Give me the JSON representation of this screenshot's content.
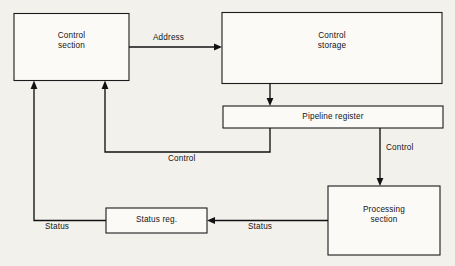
{
  "diagram": {
    "background_color": "#f3f1ec",
    "line_color": "#111111",
    "box_fill": "#fbfaf7",
    "nodes": {
      "control_section": {
        "label": "Control\nsection",
        "line1": "Control",
        "line2": "section"
      },
      "control_storage": {
        "label": "Control\nstorage",
        "line1": "Control",
        "line2": "storage"
      },
      "pipeline_register": {
        "label": "Pipeline register"
      },
      "processing_section": {
        "label": "Processing\nsection",
        "line1": "Processing",
        "line2": "section"
      },
      "status_register": {
        "label": "Status reg."
      }
    },
    "edges": {
      "address": {
        "label": "Address",
        "from": "control_section",
        "to": "control_storage"
      },
      "storage_to_pipeline": {
        "label": "",
        "from": "control_storage",
        "to": "pipeline_register"
      },
      "control_feedback": {
        "label": "Control",
        "from": "pipeline_register",
        "to": "control_section"
      },
      "control_to_processing": {
        "label": "Control",
        "from": "pipeline_register",
        "to": "processing_section"
      },
      "status_to_register": {
        "label": "Status",
        "from": "processing_section",
        "to": "status_register"
      },
      "status_to_control": {
        "label": "Status",
        "from": "status_register",
        "to": "control_section"
      }
    }
  }
}
